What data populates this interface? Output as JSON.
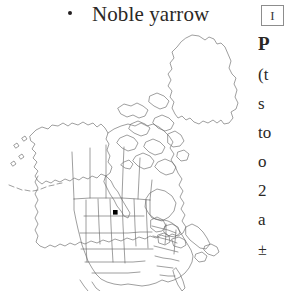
{
  "header": {
    "bullet": "•",
    "common_name": "Noble yarrow",
    "numeral": "I"
  },
  "map": {
    "label": "north-america-distribution-map",
    "region": "North America",
    "outline_color": "#6b6b6b",
    "marker_color": "#000000",
    "markers": [
      {
        "label": "distribution-point",
        "x": 115,
        "y": 212
      }
    ]
  },
  "text_column": {
    "lines": [
      {
        "text": "P",
        "style": "heading"
      },
      {
        "text": "(t",
        "style": "body"
      },
      {
        "text": "s",
        "style": "body"
      },
      {
        "text": "to",
        "style": "body"
      },
      {
        "text": "o",
        "style": "body"
      },
      {
        "text": "2",
        "style": "body"
      },
      {
        "text": "a",
        "style": "body"
      },
      {
        "text": "±",
        "style": "sym"
      }
    ]
  }
}
